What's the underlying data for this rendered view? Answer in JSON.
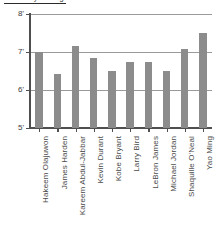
{
  "figure": {
    "cropped_heading": "NBA Player Heights",
    "background_color": "#ffffff"
  },
  "chart_data": {
    "type": "bar",
    "title": "",
    "xlabel": "",
    "ylabel": "",
    "ylim": [
      5,
      8
    ],
    "yticks": [
      5,
      6,
      7,
      8
    ],
    "ytick_labels": [
      "5'",
      "6'",
      "7'",
      "8'"
    ],
    "grid": true,
    "legend": "none",
    "units": "feet",
    "bar_color": "#8c8c8c",
    "axis_color": "#4f4f4f",
    "grid_color": "#9a9a9a",
    "categories": [
      "Hakeem Olajuwon",
      "James Harden",
      "Kareem Abdul-Jabbar",
      "Kevin Durant",
      "Kobe Bryant",
      "Larry Bird",
      "LeBron James",
      "Michael Jordan",
      "Shaquille O'Neal",
      "Yao Ming"
    ],
    "values": [
      7.0,
      6.42,
      7.17,
      6.83,
      6.5,
      6.75,
      6.75,
      6.5,
      7.08,
      7.5
    ]
  }
}
